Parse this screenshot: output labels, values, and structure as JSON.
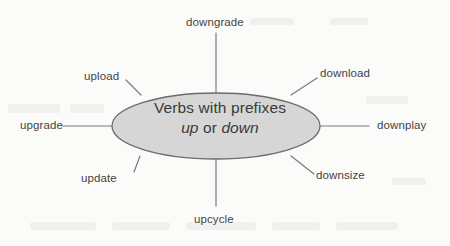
{
  "diagram": {
    "type": "word-web",
    "center": {
      "line1": "Verbs with prefixes",
      "line2_prefix_up": "up",
      "line2_conjunction": " or ",
      "line2_prefix_down": "down",
      "fill_color": "#d6d6d6",
      "stroke_color": "#6b6b6b",
      "text_color": "#3a3a3a"
    },
    "spokes": [
      {
        "label": "downgrade",
        "position": "top"
      },
      {
        "label": "download",
        "position": "top-right"
      },
      {
        "label": "downplay",
        "position": "right"
      },
      {
        "label": "downsize",
        "position": "bottom-right"
      },
      {
        "label": "upcycle",
        "position": "bottom"
      },
      {
        "label": "update",
        "position": "bottom-left"
      },
      {
        "label": "upgrade",
        "position": "left"
      },
      {
        "label": "upload",
        "position": "top-left"
      }
    ],
    "line_color": "#7a7a7a",
    "background_color": "#fbfbfa"
  }
}
